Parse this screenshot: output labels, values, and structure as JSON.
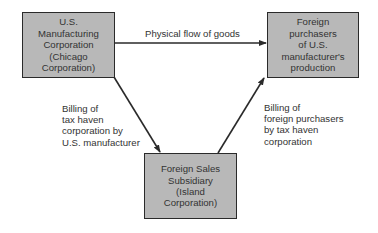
{
  "nodes": {
    "us_manufacturer": {
      "text": "U.S.\nManufacturing\nCorporation\n(Chicago\nCorporation)"
    },
    "foreign_purchasers": {
      "text": "Foreign\npurchasers\nof U.S.\nmanufacturer's\nproduction"
    },
    "foreign_sales_subsidiary": {
      "text": "Foreign Sales\nSubsidiary\n(Island\nCorporation)"
    }
  },
  "edges": {
    "goods_flow": {
      "label": "Physical flow of goods"
    },
    "billing_tax_haven": {
      "label": "Billing of\ntax haven\ncorporation by\nU.S. manufacturer"
    },
    "billing_foreign": {
      "label": "Billing of\nforeign purchasers\nby tax haven\ncorporation"
    }
  },
  "colors": {
    "box_fill": "#b8b8b8",
    "line": "#2a2a2a"
  }
}
